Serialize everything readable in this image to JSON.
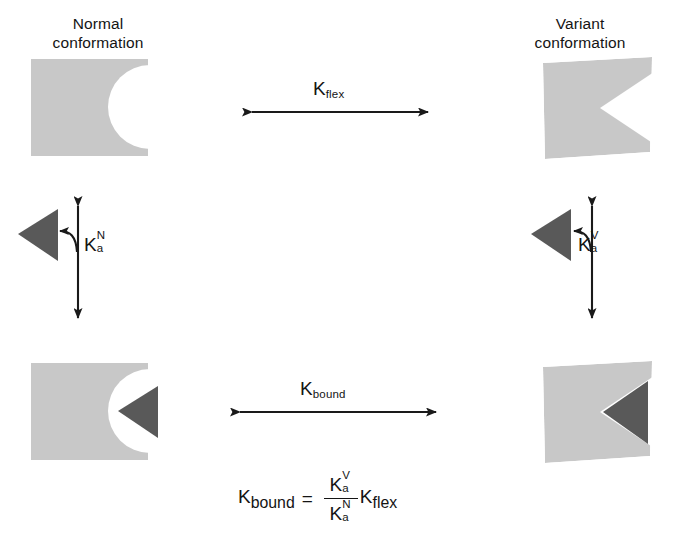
{
  "figure": {
    "type": "thermodynamic-cycle-diagram",
    "background_color": "#ffffff",
    "protein_fill": "#c8c8c8",
    "ligand_fill": "#595959",
    "stroke_color": "#1a1a1a"
  },
  "labels": {
    "normal": {
      "line1": "Normal",
      "line2": "conformation"
    },
    "variant": {
      "line1": "Variant",
      "line2": "conformation"
    }
  },
  "constants": {
    "k_glyph": "K",
    "flex": {
      "base": "K",
      "sub": "flex"
    },
    "bound": {
      "base": "K",
      "sub": "bound"
    },
    "ka_normal": {
      "base": "K",
      "sup": "N",
      "sub": "a"
    },
    "ka_variant": {
      "base": "K",
      "sup": "V",
      "sub": "a"
    }
  },
  "equation": {
    "left": {
      "base": "K",
      "sub": "bound"
    },
    "equals": "=",
    "numerator": {
      "base": "K",
      "sup": "V",
      "sub": "a"
    },
    "denominator": {
      "base": "K",
      "sup": "N",
      "sub": "a"
    },
    "multiplier": {
      "base": "K",
      "sub": "flex"
    },
    "plain_text": "K_bound = (K_a^V / K_a^N) K_flex"
  },
  "shapes": {
    "top_left": "normal-conformation-unbound",
    "top_right": "variant-conformation-unbound",
    "bottom_left": "normal-conformation-bound",
    "bottom_right": "variant-conformation-bound",
    "ligand_left": "ligand-triangle-free-normal",
    "ligand_right": "ligand-triangle-free-variant"
  },
  "arrows": {
    "top_horizontal": "double-headed-horizontal-arrow",
    "bottom_horizontal": "double-headed-horizontal-arrow",
    "left_vertical": "double-headed-vertical-arrow",
    "right_vertical": "double-headed-vertical-arrow",
    "left_curved": "curved-binding-arrow",
    "right_curved": "curved-binding-arrow"
  }
}
